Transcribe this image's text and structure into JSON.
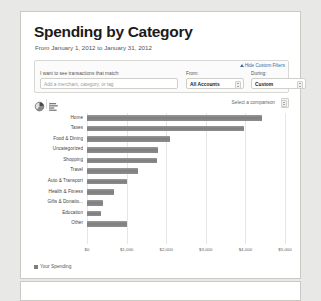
{
  "header": {
    "title": "Spending by Category",
    "subtitle": "From January 1, 2012 to January 31, 2012"
  },
  "filters": {
    "hide_custom_filters": "Hide Custom Filters",
    "match_label": "I want to see transactions that match:",
    "match_placeholder": "Add a merchant, category, or tag",
    "from_label": "From:",
    "from_value": "All Accounts",
    "during_label": "During:",
    "during_value": "Custom"
  },
  "toolbar": {
    "pie_icon": "pie-chart-icon",
    "bar_icon": "bar-chart-icon",
    "comparison_label": "Select a comparison"
  },
  "legend": {
    "series_label": "Your Spending",
    "color": "#7e7e7e"
  },
  "chart_data": {
    "type": "bar",
    "orientation": "horizontal",
    "title": "Spending by Category",
    "xlabel": "",
    "ylabel": "",
    "xlim": [
      0,
      5000
    ],
    "grid": true,
    "tick_labels": [
      "$0",
      "$1,000",
      "$2,000",
      "$3,000",
      "$4,000",
      "$5,000"
    ],
    "tick_values": [
      0,
      1000,
      2000,
      3000,
      4000,
      5000
    ],
    "legend_position": "bottom-left",
    "categories": [
      "Home",
      "Taxes",
      "Food & Dining",
      "Uncategorized",
      "Shopping",
      "Travel",
      "Auto & Transport",
      "Health & Fitness",
      "Gifts & Donatio...",
      "Education",
      "Other"
    ],
    "series": [
      {
        "name": "Your Spending",
        "values": [
          4430,
          3960,
          2090,
          1790,
          1760,
          1300,
          1000,
          690,
          400,
          360,
          1010
        ]
      }
    ]
  }
}
